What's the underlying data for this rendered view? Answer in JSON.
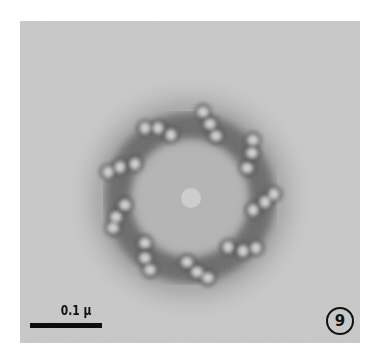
{
  "figure": {
    "type": "electron micrograph",
    "figure_number": "9",
    "scale_bar_label": "0.1 μ",
    "triplet_count": 9
  },
  "colors": {
    "background": "#c9c9c9",
    "stain_dark": "#3a3a3a",
    "tubule_light": "#d8d8d8",
    "page": "#ffffff"
  }
}
